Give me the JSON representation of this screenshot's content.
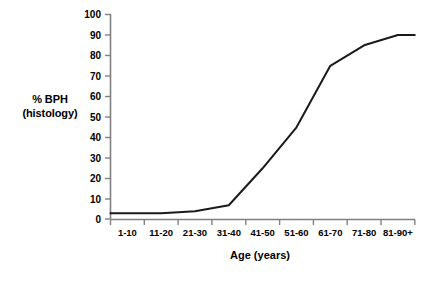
{
  "chart_data": {
    "type": "line",
    "title": "",
    "xlabel": "Age (years)",
    "ylabel": "% BPH (histology)",
    "ylabel_line1": "% BPH",
    "ylabel_line2": "(histology)",
    "categories": [
      "1-10",
      "11-20",
      "21-30",
      "31-40",
      "41-50",
      "51-60",
      "61-70",
      "71-80",
      "81-90+"
    ],
    "values": [
      3,
      3,
      4,
      7,
      25,
      45,
      75,
      85,
      90
    ],
    "ylim": [
      0,
      100
    ],
    "yticks": [
      0,
      10,
      20,
      30,
      40,
      50,
      60,
      70,
      80,
      90,
      100
    ],
    "ytick_labels": [
      "0",
      "10",
      "20",
      "30",
      "40",
      "50",
      "60",
      "70",
      "80",
      "90",
      "100"
    ],
    "grid": false,
    "legend": "none",
    "series": [
      {
        "name": "% BPH (histology)",
        "color": "#1a1a1a",
        "values": [
          3,
          3,
          4,
          7,
          25,
          45,
          75,
          85,
          90
        ]
      }
    ],
    "line_color": "#1a1a1a",
    "axis_color": "#808080"
  },
  "caption": {
    "text": "cut-off caption fragment"
  }
}
